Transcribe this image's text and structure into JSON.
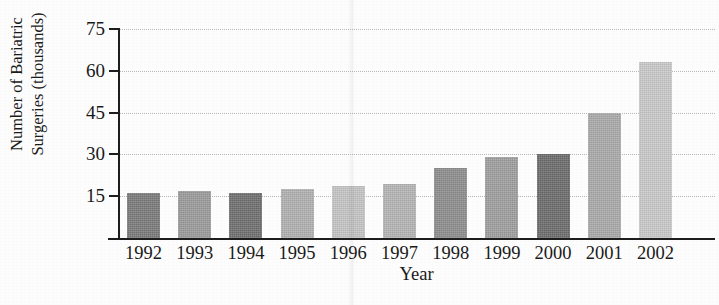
{
  "figure": {
    "cropped_title_fragment": "",
    "background_color": "#fdfdfd",
    "axis_color": "#1d1d1d",
    "gridline_color": "#b9b9b9"
  },
  "chart_data": {
    "type": "bar",
    "title": "",
    "xlabel": "Year",
    "ylabel": "Number of Bariatric Surgeries (thousands)",
    "ylabel_line1": "Number of Bariatric",
    "ylabel_line2": "Surgeries (thousands)",
    "categories": [
      "1992",
      "1993",
      "1994",
      "1995",
      "1996",
      "1997",
      "1998",
      "1999",
      "2000",
      "2001",
      "2002"
    ],
    "values": [
      16,
      17,
      16,
      17.5,
      18.5,
      19.5,
      25,
      29,
      30,
      45,
      63
    ],
    "bar_colors": [
      "#7a7a7a",
      "#9a9a9a",
      "#6e6e6e",
      "#b0b0b0",
      "#c4c4c4",
      "#b4b4b4",
      "#8c8c8c",
      "#9e9e9e",
      "#6b6b6b",
      "#a9a9a9",
      "#c9c9c9"
    ],
    "ylim": [
      0,
      75
    ],
    "yticks": [
      15,
      30,
      45,
      60,
      75
    ],
    "ytick_labels": [
      "15",
      "30",
      "45",
      "60",
      "75"
    ],
    "grid": true,
    "grid_style": "dotted",
    "legend": false,
    "legend_position": "none"
  }
}
